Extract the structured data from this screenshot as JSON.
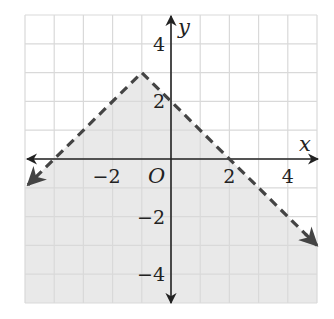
{
  "chart_data": {
    "type": "line",
    "title": "",
    "xlabel": "x",
    "ylabel": "y",
    "xlim": [
      -5,
      5
    ],
    "ylim": [
      -5,
      5
    ],
    "grid": true,
    "grid_step": 1,
    "x_tick_labels": [
      {
        "value": -2,
        "text": "−2"
      },
      {
        "value": 2,
        "text": "2"
      },
      {
        "value": 4,
        "text": "4"
      }
    ],
    "y_tick_labels": [
      {
        "value": 4,
        "text": "4"
      },
      {
        "value": 2,
        "text": "2"
      },
      {
        "value": -2,
        "text": "−2"
      },
      {
        "value": -4,
        "text": "−4"
      }
    ],
    "origin_label": "O",
    "boundary": {
      "equation": "y = -|x + 1| + 3",
      "style": "dashed",
      "vertex": [
        -1,
        3
      ],
      "points": [
        [
          -5,
          -1
        ],
        [
          -1,
          3
        ],
        [
          5,
          -3
        ]
      ],
      "x_intercepts": [
        -4,
        2
      ],
      "y_intercept": 2
    },
    "shaded_region": "below boundary (y < -|x + 1| + 3)",
    "colors": {
      "grid": "#d9d9d9",
      "shade": "#e9e9e9",
      "axis": "#222222",
      "boundary": "#444444"
    }
  }
}
